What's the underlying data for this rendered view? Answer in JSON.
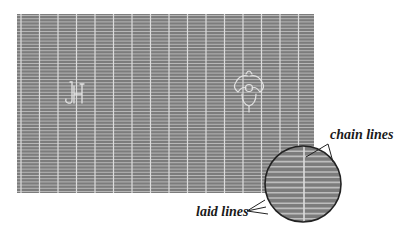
{
  "figure": {
    "colors": {
      "paper": "#7c7c7c",
      "laid_line": "#bdbdbd",
      "chain_line": "#dcdcdc",
      "watermark": "#e2e2e2",
      "outline": "#222222",
      "background": "#ffffff"
    },
    "paper_rect": {
      "x": 17,
      "y": 14,
      "width": 297,
      "height": 179
    },
    "chain_line_spacing": 18.5,
    "laid_line_spacing": 3.2,
    "watermarks": [
      {
        "name": "initials-watermark",
        "glyph": "JH",
        "x": 70,
        "y": 95
      },
      {
        "name": "flower-watermark",
        "glyph": "fleur",
        "x": 248,
        "y": 90
      }
    ],
    "magnifier": {
      "cx": 303,
      "cy": 184,
      "r": 38
    }
  },
  "labels": {
    "chain_lines": "chain lines",
    "laid_lines": "laid lines"
  }
}
